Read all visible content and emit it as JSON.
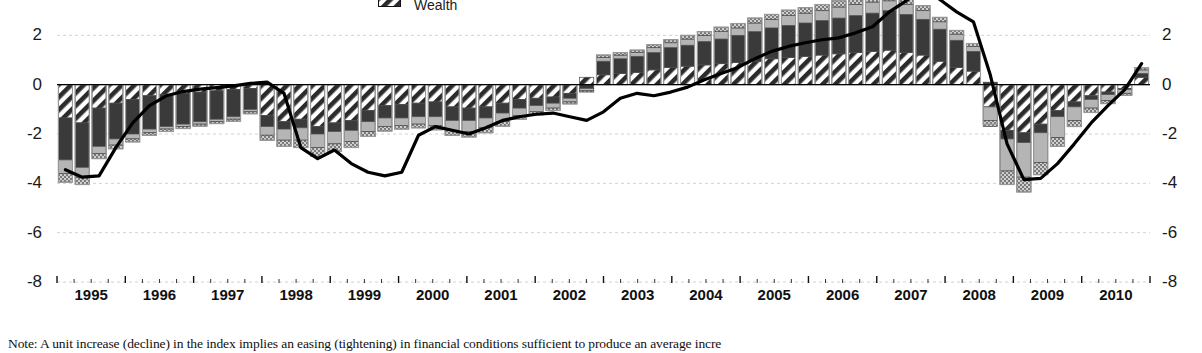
{
  "legend": {
    "items": [
      {
        "label": "Wealth",
        "pattern": "diagonal-hatch-dark",
        "color": "#2b2b2b"
      }
    ]
  },
  "note": {
    "text": "Note: A unit increase (decline) in the index implies an easing (tightening) in financial conditions sufficient to produce an average incre"
  },
  "chart_data": {
    "type": "bar",
    "title": "",
    "subtitle": "",
    "xlabel": "",
    "ylabel": "",
    "ylim": [
      -8,
      4
    ],
    "yticks": [
      4,
      2,
      0,
      -2,
      -4,
      -6,
      -8
    ],
    "ytick_labels": [
      "4",
      "2",
      "0",
      "-2",
      "-4",
      "-6",
      "-8"
    ],
    "right_axis": true,
    "right_yticks": [
      4,
      2,
      0,
      -2,
      -4,
      -6,
      -8
    ],
    "grid": true,
    "grid_style": "dashed-light",
    "legend_position": "top-center",
    "stacked": true,
    "xlabel_years": [
      "1995",
      "1996",
      "1997",
      "1998",
      "1999",
      "2000",
      "2001",
      "2002",
      "2003",
      "2004",
      "2005",
      "2006",
      "2007",
      "2008",
      "2009",
      "2010"
    ],
    "x_minor_ticks_per_year": 4,
    "x": [
      "1994Q4",
      "1995Q1",
      "1995Q2",
      "1995Q3",
      "1995Q4",
      "1996Q1",
      "1996Q2",
      "1996Q3",
      "1996Q4",
      "1997Q1",
      "1997Q2",
      "1997Q3",
      "1997Q4",
      "1998Q1",
      "1998Q2",
      "1998Q3",
      "1998Q4",
      "1999Q1",
      "1999Q2",
      "1999Q3",
      "1999Q4",
      "2000Q1",
      "2000Q2",
      "2000Q3",
      "2000Q4",
      "2001Q1",
      "2001Q2",
      "2001Q3",
      "2001Q4",
      "2002Q1",
      "2002Q2",
      "2002Q3",
      "2002Q4",
      "2003Q1",
      "2003Q2",
      "2003Q3",
      "2003Q4",
      "2004Q1",
      "2004Q2",
      "2004Q3",
      "2004Q4",
      "2005Q1",
      "2005Q2",
      "2005Q3",
      "2005Q4",
      "2006Q1",
      "2006Q2",
      "2006Q3",
      "2006Q4",
      "2007Q1",
      "2007Q2",
      "2007Q3",
      "2007Q4",
      "2008Q1",
      "2008Q2",
      "2008Q3",
      "2008Q4",
      "2009Q1",
      "2009Q2",
      "2009Q3",
      "2009Q4",
      "2010Q1",
      "2010Q2",
      "2010Q3",
      "2010Q4"
    ],
    "series": [
      {
        "name": "Wealth",
        "pattern": "diagonal-hatch-dark",
        "color": "#2b2b2b",
        "values": [
          -1.35,
          -1.55,
          -0.95,
          -0.75,
          -0.6,
          -0.45,
          -0.4,
          -0.35,
          -0.3,
          -0.25,
          -0.2,
          -0.15,
          -1.25,
          -1.5,
          -1.4,
          -1.7,
          -1.55,
          -1.45,
          -1.05,
          -0.85,
          -0.8,
          -0.75,
          -0.7,
          -0.9,
          -0.95,
          -0.9,
          -0.75,
          -0.6,
          -0.55,
          -0.5,
          -0.35,
          0.3,
          0.4,
          0.45,
          0.5,
          0.6,
          0.7,
          0.75,
          0.8,
          0.85,
          0.9,
          0.95,
          1.05,
          1.1,
          1.15,
          1.2,
          1.25,
          1.3,
          1.35,
          1.4,
          1.3,
          1.2,
          0.95,
          0.7,
          0.55,
          -0.9,
          -1.85,
          -1.95,
          -1.6,
          -1.05,
          -0.7,
          -0.45,
          -0.3,
          -0.15,
          0.3
        ]
      },
      {
        "name": "Segment B",
        "pattern": "solid-dark",
        "color": "#3a3a3a",
        "values": [
          -1.7,
          -1.8,
          -1.55,
          -1.45,
          -1.4,
          -1.35,
          -1.3,
          -1.25,
          -1.2,
          -1.15,
          -1.1,
          -0.85,
          -0.45,
          -0.3,
          -0.35,
          -0.3,
          -0.35,
          -0.4,
          -0.45,
          -0.5,
          -0.55,
          -0.55,
          -0.6,
          -0.55,
          -0.5,
          -0.45,
          -0.4,
          -0.35,
          -0.3,
          -0.25,
          -0.2,
          -0.15,
          0.55,
          0.6,
          0.65,
          0.7,
          0.8,
          0.85,
          0.95,
          1.0,
          1.1,
          1.2,
          1.25,
          1.3,
          1.35,
          1.4,
          1.45,
          1.5,
          1.55,
          1.6,
          1.55,
          1.45,
          1.3,
          1.1,
          0.8,
          0.1,
          -0.35,
          -0.4,
          -0.35,
          -0.25,
          -0.2,
          -0.15,
          -0.1,
          -0.05,
          0.15
        ]
      },
      {
        "name": "Segment C",
        "pattern": "light-gray",
        "color": "#b5b5b5",
        "values": [
          -0.55,
          -0.4,
          -0.3,
          -0.25,
          -0.2,
          -0.15,
          -0.1,
          -0.1,
          -0.1,
          -0.1,
          -0.1,
          -0.1,
          -0.35,
          -0.45,
          -0.5,
          -0.55,
          -0.5,
          -0.45,
          -0.4,
          -0.35,
          -0.3,
          -0.3,
          -0.35,
          -0.4,
          -0.45,
          -0.4,
          -0.35,
          -0.3,
          -0.25,
          -0.2,
          -0.15,
          -0.1,
          0.15,
          0.15,
          0.15,
          0.2,
          0.2,
          0.25,
          0.25,
          0.3,
          0.3,
          0.35,
          0.35,
          0.4,
          0.4,
          0.4,
          0.45,
          0.45,
          0.45,
          0.4,
          0.4,
          0.35,
          0.3,
          0.25,
          0.2,
          -0.55,
          -1.3,
          -1.4,
          -1.2,
          -0.85,
          -0.55,
          -0.35,
          -0.25,
          -0.15,
          0.15
        ]
      },
      {
        "name": "Segment D",
        "pattern": "checker",
        "color": "#8f8f8f",
        "values": [
          -0.35,
          -0.3,
          -0.2,
          -0.15,
          -0.12,
          -0.1,
          -0.1,
          -0.08,
          -0.08,
          -0.08,
          -0.08,
          -0.08,
          -0.2,
          -0.25,
          -0.3,
          -0.35,
          -0.3,
          -0.25,
          -0.2,
          -0.18,
          -0.15,
          -0.15,
          -0.18,
          -0.2,
          -0.22,
          -0.2,
          -0.18,
          -0.15,
          -0.12,
          -0.1,
          -0.08,
          -0.05,
          0.1,
          0.1,
          0.1,
          0.12,
          0.12,
          0.15,
          0.15,
          0.18,
          0.18,
          0.2,
          0.2,
          0.22,
          0.22,
          0.25,
          0.25,
          0.25,
          0.25,
          0.25,
          0.22,
          0.2,
          0.18,
          0.15,
          0.12,
          -0.25,
          -0.55,
          -0.6,
          -0.5,
          -0.35,
          -0.25,
          -0.18,
          -0.12,
          -0.08,
          0.08
        ]
      }
    ],
    "line_series": {
      "name": "Index",
      "color": "#000000",
      "width": 3.2,
      "values": [
        -3.45,
        -3.75,
        -3.7,
        -2.55,
        -1.55,
        -0.85,
        -0.45,
        -0.28,
        -0.18,
        -0.12,
        -0.05,
        0.05,
        0.1,
        -0.35,
        -2.55,
        -3.0,
        -2.65,
        -3.2,
        -3.55,
        -3.7,
        -3.55,
        -2.05,
        -1.7,
        -1.85,
        -2.0,
        -1.75,
        -1.45,
        -1.3,
        -1.2,
        -1.15,
        -1.3,
        -1.45,
        -1.1,
        -0.55,
        -0.35,
        -0.45,
        -0.3,
        -0.1,
        0.2,
        0.45,
        0.7,
        1.05,
        1.35,
        1.55,
        1.7,
        1.82,
        1.9,
        2.1,
        2.35,
        2.95,
        3.4,
        3.95,
        3.45,
        2.95,
        2.55,
        0.4,
        -2.4,
        -3.85,
        -3.8,
        -3.2,
        -2.4,
        -1.55,
        -0.85,
        -0.2,
        0.85
      ]
    }
  }
}
